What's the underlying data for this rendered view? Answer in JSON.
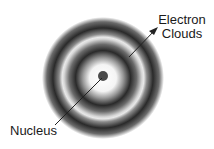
{
  "diagram": {
    "type": "atom-electron-cloud",
    "labels": {
      "electron_clouds_line1": "Electron",
      "electron_clouds_line2": "Clouds",
      "nucleus": "Nucleus"
    },
    "colors": {
      "background": "#ffffff",
      "cloud_dark": "#1a1a1a",
      "nucleus": "#4a4a4a",
      "arrow": "#222222"
    }
  }
}
